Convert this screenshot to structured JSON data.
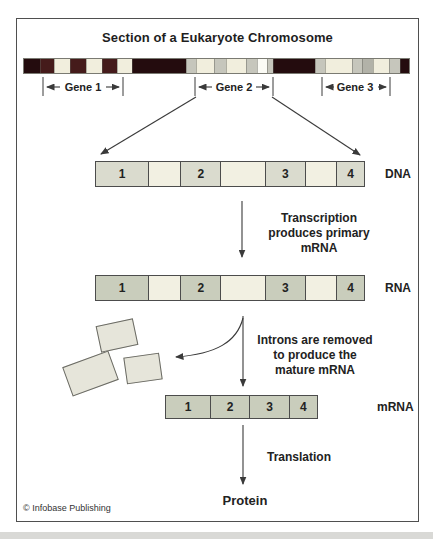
{
  "title": "Section of a Eukaryote Chromosome",
  "colors": {
    "frame_border": "#4f4f4f",
    "line": "#3a3a3a",
    "chromosome": {
      "dark": "#240c0e",
      "maroon": "#451b1b",
      "cream": "#f1eedd",
      "gray": "#c6c6bc",
      "gray2": "#b2b2a8",
      "white": "#fbfbf5"
    },
    "dna_exon_fill": "#dadbce",
    "rna_exon_fill": "#c9cdbc",
    "intron_fill": "#f2f0e2",
    "removed_piece_fill": "#e6e5da",
    "bottom_band": "#d9d9d6"
  },
  "chromosome": {
    "segments": [
      {
        "color": "dark",
        "w": 17
      },
      {
        "color": "maroon",
        "w": 14
      },
      {
        "color": "cream",
        "w": 16
      },
      {
        "color": "maroon",
        "w": 16
      },
      {
        "color": "cream",
        "w": 16
      },
      {
        "color": "maroon",
        "w": 16
      },
      {
        "color": "cream",
        "w": 15
      },
      {
        "color": "dark",
        "w": 57
      },
      {
        "color": "gray",
        "w": 9
      },
      {
        "color": "cream",
        "w": 18
      },
      {
        "color": "gray",
        "w": 12
      },
      {
        "color": "cream",
        "w": 21
      },
      {
        "color": "gray",
        "w": 10
      },
      {
        "color": "white",
        "w": 10
      },
      {
        "color": "gray",
        "w": 5
      },
      {
        "color": "dark",
        "w": 44
      },
      {
        "color": "gray",
        "w": 10
      },
      {
        "color": "cream",
        "w": 28
      },
      {
        "color": "gray",
        "w": 10
      },
      {
        "color": "gray2",
        "w": 10
      },
      {
        "color": "cream",
        "w": 17
      },
      {
        "color": "gray",
        "w": 10
      },
      {
        "color": "dark",
        "w": 9
      }
    ]
  },
  "genes": [
    {
      "label": "Gene 1"
    },
    {
      "label": "Gene 2"
    },
    {
      "label": "Gene 3"
    }
  ],
  "bars": {
    "dna": {
      "label": "DNA",
      "segments": [
        {
          "text": "1",
          "type": "exon",
          "w": 52
        },
        {
          "text": "",
          "type": "intron",
          "w": 36
        },
        {
          "text": "2",
          "type": "exon",
          "w": 37
        },
        {
          "text": "",
          "type": "intron",
          "w": 50
        },
        {
          "text": "3",
          "type": "exon",
          "w": 37
        },
        {
          "text": "",
          "type": "intron",
          "w": 35
        },
        {
          "text": "4",
          "type": "exon",
          "w": 23
        }
      ]
    },
    "rna": {
      "label": "RNA",
      "segments": [
        {
          "text": "1",
          "type": "exon",
          "w": 52
        },
        {
          "text": "",
          "type": "intron",
          "w": 36
        },
        {
          "text": "2",
          "type": "exon",
          "w": 37
        },
        {
          "text": "",
          "type": "intron",
          "w": 50
        },
        {
          "text": "3",
          "type": "exon",
          "w": 37
        },
        {
          "text": "",
          "type": "intron",
          "w": 35
        },
        {
          "text": "4",
          "type": "exon",
          "w": 23
        }
      ]
    },
    "mrna": {
      "label": "mRNA",
      "segments": [
        {
          "text": "1",
          "type": "exon",
          "w": 47
        },
        {
          "text": "2",
          "type": "exon",
          "w": 40
        },
        {
          "text": "3",
          "type": "exon",
          "w": 40
        },
        {
          "text": "4",
          "type": "exon",
          "w": 26
        }
      ]
    }
  },
  "annotations": {
    "transcription_lines": [
      "Transcription",
      "produces primary",
      "mRNA"
    ],
    "introns_lines": [
      "Introns are removed",
      "to produce the",
      "mature mRNA"
    ],
    "translation": "Translation",
    "protein": "Protein"
  },
  "copyright": "© Infobase Publishing"
}
